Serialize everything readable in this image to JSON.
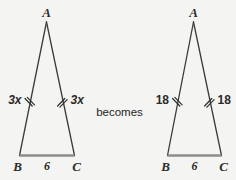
{
  "figure": {
    "connector_text": "becomes",
    "background_color": "#f4f4f2",
    "leg_color": "#3a3a3a",
    "base_color": "#8d8d8d",
    "tick_color": "#2e2e2e",
    "label_color": "#2b2b2b",
    "triangles": [
      {
        "id": "left-triangle",
        "apex_label": "A",
        "base_left_label": "B",
        "base_right_label": "C",
        "left_leg_label": "3x",
        "right_leg_label": "3x",
        "base_label": "6",
        "leg_label_style": "italic",
        "tick_marks_per_leg": 2
      },
      {
        "id": "right-triangle",
        "apex_label": "A",
        "base_left_label": "B",
        "base_right_label": "C",
        "left_leg_label": "18",
        "right_leg_label": "18",
        "base_label": "6",
        "leg_label_style": "upright",
        "tick_marks_per_leg": 2
      }
    ]
  }
}
